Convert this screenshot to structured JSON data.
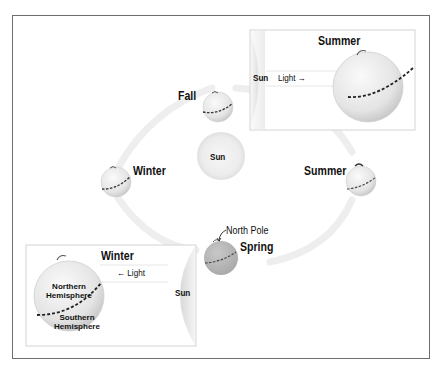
{
  "diagram": {
    "sun": {
      "label": "Sun"
    },
    "orbit_positions": [
      {
        "season": "Fall",
        "position": "top"
      },
      {
        "season": "Winter",
        "position": "left"
      },
      {
        "season": "Summer",
        "position": "right"
      },
      {
        "season": "Spring",
        "position": "bottom",
        "annotation": "North Pole"
      }
    ],
    "insets": {
      "summer": {
        "title": "Summer",
        "sun_label": "Sun",
        "light_label": "Light",
        "light_arrow": "→"
      },
      "winter": {
        "title": "Winter",
        "sun_label": "Sun",
        "light_label": "Light",
        "light_arrow": "←",
        "northern_label_1": "Northern",
        "northern_label_2": "Hemisphere",
        "southern_label_1": "Southern",
        "southern_label_2": "Hemisphere"
      }
    },
    "colors": {
      "frame": "#6e6e6e",
      "globe": "#e6e6e6",
      "globe_dark": "#b8b8b8",
      "sun": "#eeeeee",
      "orbit": "#efefef",
      "equator": "#333333",
      "inset_border": "#d4d4d4"
    }
  }
}
